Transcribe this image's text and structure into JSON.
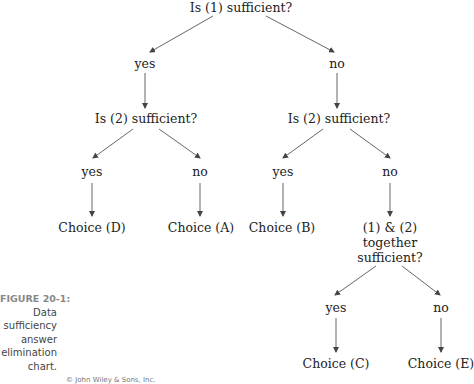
{
  "diagram": {
    "type": "decision-tree",
    "title": "Data sufficiency answer elimination chart",
    "nodes": {
      "root": "Is (1) sufficient?",
      "l1_yes": "yes",
      "l1_no": "no",
      "left_q2": "Is (2) sufficient?",
      "right_q2": "Is (2) sufficient?",
      "left_yes": "yes",
      "left_no": "no",
      "right_yes": "yes",
      "right_no": "no",
      "choice_d": "Choice (D)",
      "choice_a": "Choice (A)",
      "choice_b": "Choice (B)",
      "together": [
        "(1) & (2)",
        "together",
        "sufficient?"
      ],
      "together_yes": "yes",
      "together_no": "no",
      "choice_c": "Choice (C)",
      "choice_e": "Choice (E)"
    },
    "edges": [
      {
        "from": "Is (1) sufficient?",
        "to": "yes"
      },
      {
        "from": "Is (1) sufficient?",
        "to": "no"
      },
      {
        "from": "yes",
        "to": "Is (2) sufficient? (left)"
      },
      {
        "from": "no",
        "to": "Is (2) sufficient? (right)"
      },
      {
        "from": "Is (2) sufficient? (left)",
        "to": "yes"
      },
      {
        "from": "Is (2) sufficient? (left)",
        "to": "no"
      },
      {
        "from": "yes",
        "to": "Choice (D)"
      },
      {
        "from": "no",
        "to": "Choice (A)"
      },
      {
        "from": "Is (2) sufficient? (right)",
        "to": "yes"
      },
      {
        "from": "Is (2) sufficient? (right)",
        "to": "no"
      },
      {
        "from": "yes",
        "to": "Choice (B)"
      },
      {
        "from": "no",
        "to": "(1) & (2) together sufficient?"
      },
      {
        "from": "(1) & (2) together sufficient?",
        "to": "yes"
      },
      {
        "from": "(1) & (2) together sufficient?",
        "to": "no"
      },
      {
        "from": "yes",
        "to": "Choice (C)"
      },
      {
        "from": "no",
        "to": "Choice (E)"
      }
    ]
  },
  "caption": {
    "label": "FIGURE 20-1:",
    "lines": [
      "Data",
      "sufficiency",
      "answer",
      "elimination",
      "chart."
    ]
  },
  "credit": "© John Wiley & Sons, Inc.",
  "colors": {
    "text": "#222222",
    "arrow": "#444444",
    "caption_label": "#888888"
  }
}
